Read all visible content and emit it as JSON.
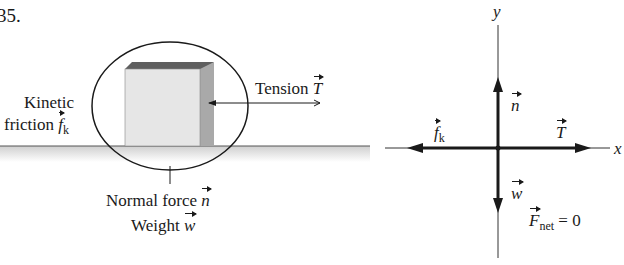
{
  "problem_number": "35.",
  "scene": {
    "labels": {
      "tension": "Tension",
      "tension_symbol": "T",
      "kinetic": "Kinetic",
      "friction": "friction",
      "friction_symbol": "f",
      "friction_sub": "k",
      "normal": "Normal force",
      "normal_symbol": "n",
      "weight": "Weight",
      "weight_symbol": "w"
    }
  },
  "free_body_diagram": {
    "axis_y": "y",
    "axis_x": "x",
    "forces": {
      "normal": "n",
      "weight": "w",
      "friction": "f",
      "friction_sub": "k",
      "tension": "T"
    },
    "net_symbol": "F",
    "net_sub": "net",
    "net_equation": "= 0"
  },
  "colors": {
    "ink": "#1a1a1a",
    "box_front": "#e6e6e6",
    "box_side": "#a9a9a9",
    "box_top": "#5f5f5f",
    "ground": "#d6d6d6"
  }
}
